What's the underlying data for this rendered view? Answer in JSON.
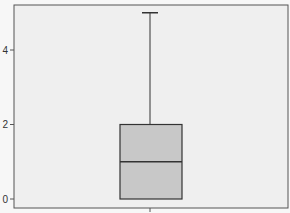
{
  "chart_data": {
    "type": "boxplot",
    "title": "",
    "xlabel": "",
    "ylabel": "",
    "ylim": [
      -0.1,
      5.2
    ],
    "yticks": [
      0,
      2,
      4
    ],
    "ytick_labels": [
      "0",
      "2",
      "4"
    ],
    "grid": false,
    "legend": null,
    "series": [
      {
        "name": "",
        "min": 0,
        "q1": 0,
        "median": 1,
        "q3": 2,
        "max": 5
      }
    ]
  },
  "colors": {
    "plot_background": "#efefef",
    "page_background": "#f7f7f7",
    "box_fill": "#c8c8c8",
    "box_stroke": "#333333",
    "axis": "#555555"
  }
}
